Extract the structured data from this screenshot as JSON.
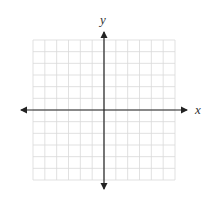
{
  "diagram": {
    "type": "cartesian-coordinate-grid",
    "x_axis_label": "x",
    "y_axis_label": "y",
    "grid": {
      "columns": 12,
      "rows": 12,
      "left": 33,
      "top": 40,
      "right": 175,
      "bottom": 180
    },
    "origin": {
      "x": 104,
      "y": 110
    },
    "colors": {
      "grid": "#d9d9d9",
      "axis": "#222222",
      "label": "#333333"
    }
  }
}
